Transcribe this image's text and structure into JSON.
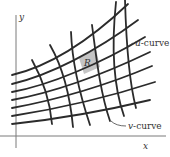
{
  "diagram": {
    "axes": {
      "x_label": "x",
      "y_label": "y"
    },
    "labels": {
      "u_curve_var": "u",
      "u_curve_suffix": "-curve",
      "v_curve_var": "v",
      "v_curve_suffix": "-curve",
      "region": "R"
    },
    "colors": {
      "curve": "#2b2b2b",
      "axis": "#7a7a7a",
      "region_fill": "#c4c4c4",
      "background": "#ffffff"
    },
    "u_curves": [
      "M12,124 C50,120 100,112 150,100",
      "M12,116 C50,110 100,100 155,82",
      "M12,108 C50,101 100,88 152,66",
      "M12,100 C50,93 100,76 150,52",
      "M12,92 C50,85 100,64 145,37",
      "M12,84 C50,75 95,52 138,20",
      "M12,75 C50,66 90,40 128,4"
    ],
    "v_curves": [
      "M32,60 C42,78 50,100 52,124",
      "M50,45 C62,66 70,95 73,127",
      "M71,32 C72,60 80,95 90,125",
      "M92,25 C96,55 100,92 110,121",
      "M116,2 C112,40 112,82 124,116",
      "M125,0 C126,35 128,78 136,108"
    ],
    "region_path": "M79,58 L96,49 L100,67 L84,74 Z",
    "label_positions": {
      "u_curve": {
        "x": 135,
        "y": 46
      },
      "v_curve": {
        "x": 128,
        "y": 128
      },
      "region": {
        "x": 86,
        "y": 66
      },
      "x_axis": {
        "x": 143,
        "y": 148
      },
      "y_axis": {
        "x": 19,
        "y": 19
      }
    }
  }
}
